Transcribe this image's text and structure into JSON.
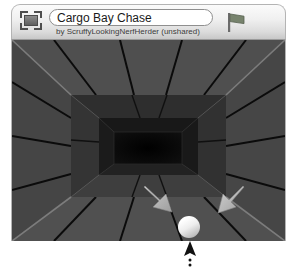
{
  "window": {
    "title_value": "Cargo Bay Chase",
    "title_placeholder": "Untitled",
    "byline": "by ScruffyLookingNerfHerder (unshared)",
    "thumbnail_icon": "thumbnail-icon"
  },
  "toolbar": {
    "flag": {
      "icon": "flag-icon",
      "label": "Flag",
      "color": "#6f7a66"
    },
    "stop": {
      "icon": "octagon-stop-icon",
      "label": "Stop",
      "color": "#242424"
    }
  },
  "scene": {
    "name": "cargo-bay-corridor",
    "wall_color": "#4a4a4a",
    "wall_color_dark": "#3c3c3c",
    "seam_color": "#0a0a0a",
    "edge_highlight": "#9a9a9a",
    "tunnel_color": "#060606",
    "ball": {
      "name": "player-ball",
      "color": "#f2f2f2",
      "x": 188,
      "y": 224,
      "r": 11
    },
    "arrows": [
      {
        "name": "force-arrow-left",
        "color": "#b9b9b9",
        "direction": "down-right"
      },
      {
        "name": "force-arrow-right",
        "color": "#b9b9b9",
        "direction": "up-right"
      }
    ]
  },
  "cursor": {
    "name": "mouse-pointer",
    "x": 190,
    "y": 244,
    "color": "#111111",
    "trail": "dotted"
  }
}
